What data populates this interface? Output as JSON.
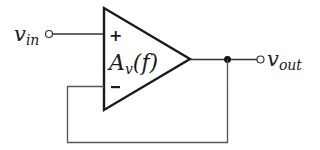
{
  "diagram": {
    "type": "op-amp voltage follower (unity-gain buffer)",
    "input_label": {
      "main": "v",
      "sub": "in"
    },
    "output_label": {
      "main": "v",
      "sub": "out"
    },
    "amplifier": {
      "gain_label": {
        "main": "A",
        "sub": "v",
        "arg": "(f)"
      },
      "noninverting_symbol": "+",
      "inverting_symbol": "−"
    },
    "colors": {
      "stroke": "#1a1a1a",
      "feedback_wire": "#555555",
      "background": "#ffffff"
    }
  }
}
